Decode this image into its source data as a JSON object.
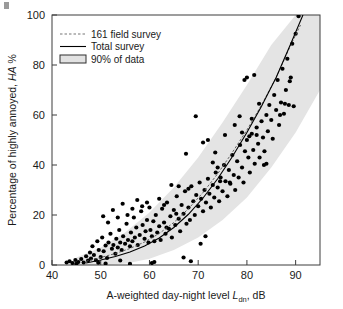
{
  "figure": {
    "name": "noise-annoyance-dose-response",
    "corner_mark": "page-corner-artifact"
  },
  "chart_data": {
    "type": "scatter",
    "title": "",
    "xlabel": "A-weighted day-night level Ldn, dB",
    "xlabel_parts": {
      "prefix": "A-weighted day-night level ",
      "symbol": "L",
      "subscript": "dn",
      "suffix": ", dB"
    },
    "ylabel": "Percentage of highly annoyed, HA %",
    "ylabel_parts": {
      "prefix": "Percentage of highly annoyed, ",
      "symbol": "HA",
      "suffix": " %"
    },
    "xlim": [
      40,
      95
    ],
    "ylim": [
      0,
      100
    ],
    "xticks": [
      40,
      50,
      60,
      70,
      80,
      90
    ],
    "yticks": [
      0,
      20,
      40,
      60,
      80,
      100
    ],
    "grid": false,
    "legend_position": "top-left",
    "legend": [
      {
        "label": "161 field survey",
        "style": "dashed-line",
        "color": "#777777"
      },
      {
        "label": "Total survey",
        "style": "solid-line",
        "color": "#000000"
      },
      {
        "label": "90% of data",
        "style": "filled-rect",
        "color": "#e2e2e2"
      }
    ],
    "series": [
      {
        "name": "161 field survey",
        "type": "line",
        "style": "dashed",
        "color": "#555555",
        "x": [
          47,
          50,
          53,
          56,
          59,
          62,
          65,
          68,
          71,
          74,
          77,
          80,
          83,
          86,
          89,
          91
        ],
        "y": [
          1.5,
          3.0,
          4.6,
          6.6,
          9.2,
          12.6,
          17.0,
          22.5,
          29.0,
          36.5,
          45.0,
          54.0,
          64.0,
          75.0,
          88.0,
          96.0
        ]
      },
      {
        "name": "Total survey",
        "type": "line",
        "style": "solid",
        "color": "#000000",
        "x": [
          47,
          50,
          53,
          56,
          59,
          62,
          65,
          68,
          71,
          74,
          77,
          80,
          83,
          86,
          89,
          91.5
        ],
        "y": [
          0.8,
          2.0,
          3.4,
          5.2,
          7.6,
          10.8,
          15.0,
          20.3,
          26.8,
          34.5,
          43.3,
          53.0,
          63.5,
          75.0,
          88.5,
          100.0
        ]
      },
      {
        "name": "90% of data",
        "type": "band",
        "color": "#e4e4e4",
        "x": [
          45,
          50,
          55,
          60,
          65,
          70,
          75,
          80,
          85,
          90,
          95
        ],
        "y_lower": [
          0,
          0,
          0.5,
          2.5,
          6.0,
          11.0,
          18.0,
          27.0,
          39.0,
          53.0,
          70.0
        ],
        "y_upper": [
          3.0,
          7.0,
          13.0,
          21.0,
          31.0,
          43.0,
          57.0,
          72.0,
          88.0,
          100.0,
          100.0
        ]
      },
      {
        "name": "survey points",
        "type": "scatter",
        "color": "#000000",
        "marker": "circle",
        "points": [
          [
            43.0,
            1.0
          ],
          [
            43.6,
            1.5
          ],
          [
            44.2,
            0.8
          ],
          [
            44.8,
            2.0
          ],
          [
            45.4,
            1.2
          ],
          [
            46.0,
            2.4
          ],
          [
            46.5,
            1.0
          ],
          [
            47.0,
            3.5
          ],
          [
            47.4,
            1.8
          ],
          [
            47.8,
            5.0
          ],
          [
            48.0,
            2.6
          ],
          [
            48.3,
            7.5
          ],
          [
            48.6,
            4.0
          ],
          [
            49.0,
            2.0
          ],
          [
            49.3,
            9.5
          ],
          [
            49.6,
            6.0
          ],
          [
            50.0,
            3.2
          ],
          [
            50.3,
            11.0
          ],
          [
            50.6,
            5.5
          ],
          [
            51.0,
            7.8
          ],
          [
            51.3,
            2.8
          ],
          [
            51.6,
            9.0
          ],
          [
            52.0,
            12.5
          ],
          [
            52.3,
            6.5
          ],
          [
            52.6,
            8.0
          ],
          [
            53.0,
            4.5
          ],
          [
            53.2,
            10.5
          ],
          [
            53.5,
            7.0
          ],
          [
            53.8,
            14.0
          ],
          [
            54.0,
            9.0
          ],
          [
            54.3,
            6.0
          ],
          [
            54.6,
            11.5
          ],
          [
            55.0,
            8.5
          ],
          [
            55.3,
            16.5
          ],
          [
            55.6,
            10.0
          ],
          [
            56.0,
            7.5
          ],
          [
            56.2,
            13.0
          ],
          [
            56.5,
            9.5
          ],
          [
            56.8,
            19.0
          ],
          [
            57.0,
            11.0
          ],
          [
            57.3,
            15.0
          ],
          [
            57.6,
            8.0
          ],
          [
            58.0,
            12.0
          ],
          [
            58.3,
            21.5
          ],
          [
            58.6,
            16.0
          ],
          [
            59.0,
            10.5
          ],
          [
            59.2,
            13.5
          ],
          [
            59.5,
            18.0
          ],
          [
            59.8,
            9.0
          ],
          [
            60.0,
            23.0
          ],
          [
            50.5,
            19.5
          ],
          [
            52.5,
            22.0
          ],
          [
            54.5,
            24.5
          ],
          [
            55.5,
            20.0
          ],
          [
            57.5,
            26.0
          ],
          [
            58.5,
            23.5
          ],
          [
            51.5,
            17.0
          ],
          [
            53.5,
            19.0
          ],
          [
            56.5,
            22.5
          ],
          [
            59.5,
            25.0
          ],
          [
            60.2,
            14.0
          ],
          [
            60.5,
            11.5
          ],
          [
            60.8,
            17.5
          ],
          [
            61.0,
            9.5
          ],
          [
            61.3,
            20.0
          ],
          [
            61.6,
            13.0
          ],
          [
            62.0,
            15.5
          ],
          [
            62.3,
            10.0
          ],
          [
            62.6,
            22.5
          ],
          [
            63.0,
            17.0
          ],
          [
            63.3,
            12.5
          ],
          [
            63.6,
            25.0
          ],
          [
            64.0,
            14.5
          ],
          [
            64.3,
            19.5
          ],
          [
            64.6,
            11.0
          ],
          [
            65.0,
            22.0
          ],
          [
            65.3,
            16.0
          ],
          [
            65.6,
            27.5
          ],
          [
            66.0,
            18.5
          ],
          [
            66.3,
            13.5
          ],
          [
            66.6,
            24.0
          ],
          [
            67.0,
            20.5
          ],
          [
            67.3,
            29.5
          ],
          [
            67.6,
            16.5
          ],
          [
            68.0,
            23.0
          ],
          [
            68.3,
            18.0
          ],
          [
            68.6,
            31.5
          ],
          [
            69.0,
            25.5
          ],
          [
            69.3,
            20.0
          ],
          [
            69.6,
            28.0
          ],
          [
            70.0,
            23.5
          ],
          [
            70.3,
            33.0
          ],
          [
            70.6,
            26.5
          ],
          [
            71.0,
            21.5
          ],
          [
            71.3,
            30.0
          ],
          [
            71.6,
            25.0
          ],
          [
            72.0,
            34.5
          ],
          [
            72.3,
            28.5
          ],
          [
            72.6,
            23.0
          ],
          [
            73.0,
            32.0
          ],
          [
            73.3,
            27.0
          ],
          [
            73.6,
            37.0
          ],
          [
            74.0,
            31.0
          ],
          [
            74.3,
            25.5
          ],
          [
            74.6,
            35.0
          ],
          [
            75.0,
            29.5
          ],
          [
            75.3,
            40.0
          ],
          [
            75.6,
            33.5
          ],
          [
            76.0,
            27.5
          ],
          [
            76.3,
            38.0
          ],
          [
            76.6,
            32.5
          ],
          [
            77.0,
            44.0
          ],
          [
            77.3,
            36.0
          ],
          [
            77.6,
            30.0
          ],
          [
            78.0,
            41.5
          ],
          [
            78.3,
            35.0
          ],
          [
            78.6,
            48.0
          ],
          [
            79.0,
            39.0
          ],
          [
            79.3,
            33.0
          ],
          [
            79.6,
            45.5
          ],
          [
            80.0,
            50.0
          ],
          [
            80.3,
            43.0
          ],
          [
            80.6,
            37.0
          ],
          [
            81.0,
            52.5
          ],
          [
            81.3,
            46.0
          ],
          [
            81.6,
            40.5
          ],
          [
            82.0,
            55.0
          ],
          [
            82.3,
            48.5
          ],
          [
            82.6,
            43.0
          ],
          [
            83.0,
            57.5
          ],
          [
            83.3,
            51.0
          ],
          [
            83.6,
            45.5
          ],
          [
            84.0,
            60.0
          ],
          [
            84.3,
            53.5
          ],
          [
            84.6,
            64.0
          ],
          [
            85.0,
            58.0
          ],
          [
            85.3,
            50.5
          ],
          [
            85.6,
            68.0
          ],
          [
            86.0,
            62.0
          ],
          [
            86.3,
            74.0
          ],
          [
            86.6,
            56.0
          ],
          [
            87.0,
            65.0
          ],
          [
            87.3,
            78.5
          ],
          [
            87.6,
            60.5
          ],
          [
            88.0,
            70.0
          ],
          [
            88.3,
            82.5
          ],
          [
            88.6,
            64.0
          ],
          [
            89.0,
            75.0
          ],
          [
            89.3,
            88.5
          ],
          [
            89.6,
            63.5
          ],
          [
            90.0,
            92.5
          ],
          [
            90.6,
            99.5
          ],
          [
            88.8,
            73.5
          ],
          [
            87.8,
            64.5
          ],
          [
            86.8,
            60.0
          ],
          [
            79.5,
            74.0
          ],
          [
            80.0,
            75.0
          ],
          [
            78.5,
            59.5
          ],
          [
            81.5,
            76.0
          ],
          [
            82.5,
            64.5
          ],
          [
            83.5,
            40.0
          ],
          [
            84.0,
            40.5
          ],
          [
            73.5,
            45.0
          ],
          [
            74.5,
            33.5
          ],
          [
            76.5,
            33.0
          ],
          [
            69.5,
            59.5
          ],
          [
            71.0,
            49.0
          ],
          [
            72.0,
            50.0
          ],
          [
            67.5,
            44.5
          ],
          [
            64.5,
            32.0
          ],
          [
            62.0,
            26.5
          ],
          [
            63.0,
            24.0
          ],
          [
            66.0,
            31.5
          ],
          [
            68.0,
            30.5
          ],
          [
            70.5,
            8.5
          ],
          [
            71.5,
            11.5
          ],
          [
            68.5,
            1.5
          ],
          [
            67.0,
            3.0
          ],
          [
            61.0,
            1.2
          ],
          [
            60.5,
            0.8
          ],
          [
            56.0,
            0.5
          ],
          [
            54.0,
            1.8
          ],
          [
            51.0,
            0.6
          ],
          [
            49.5,
            0.9
          ],
          [
            45.0,
            0.5
          ],
          [
            75.5,
            52.0
          ],
          [
            77.5,
            56.0
          ],
          [
            79.0,
            53.0
          ],
          [
            80.5,
            51.5
          ],
          [
            81.0,
            58.5
          ],
          [
            82.0,
            52.0
          ],
          [
            73.0,
            41.0
          ],
          [
            74.0,
            39.0
          ],
          [
            65.5,
            20.5
          ],
          [
            63.5,
            15.0
          ]
        ]
      }
    ]
  }
}
